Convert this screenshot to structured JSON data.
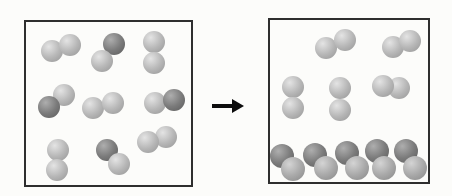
{
  "scene": {
    "width": 452,
    "height": 196,
    "background": "#fcfcfa",
    "panel_border_color": "#2e2e2e",
    "panel_border_width": 2
  },
  "shades": {
    "light": {
      "base": "#b7b7b7",
      "highlight": "#e4e4e4",
      "edge": "#969696"
    },
    "dark": {
      "base": "#7b7b7b",
      "highlight": "#aeaeae",
      "edge": "#5c5c5c"
    },
    "medium": {
      "base": "#a9a9a9",
      "highlight": "#d4d4d4",
      "edge": "#898989"
    }
  },
  "arrow": {
    "x": 212,
    "y": 99,
    "width": 32,
    "height": 14,
    "shaft_length": 20,
    "shaft_thickness": 4,
    "color": "#0d0d0d"
  },
  "panels": [
    {
      "name": "before-box",
      "x": 24,
      "y": 20,
      "width": 169,
      "height": 167,
      "molecules": [
        {
          "atoms": [
            {
              "cx": 52,
              "cy": 51,
              "r": 11,
              "shade": "light"
            },
            {
              "cx": 70,
              "cy": 45,
              "r": 11,
              "shade": "light"
            }
          ]
        },
        {
          "atoms": [
            {
              "cx": 114,
              "cy": 44,
              "r": 11,
              "shade": "dark"
            },
            {
              "cx": 102,
              "cy": 61,
              "r": 11,
              "shade": "light"
            }
          ]
        },
        {
          "atoms": [
            {
              "cx": 154,
              "cy": 42,
              "r": 11,
              "shade": "light"
            },
            {
              "cx": 154,
              "cy": 63,
              "r": 11,
              "shade": "light"
            }
          ]
        },
        {
          "atoms": [
            {
              "cx": 64,
              "cy": 95,
              "r": 11,
              "shade": "light"
            },
            {
              "cx": 49,
              "cy": 107,
              "r": 11,
              "shade": "dark"
            }
          ]
        },
        {
          "atoms": [
            {
              "cx": 93,
              "cy": 108,
              "r": 11,
              "shade": "light"
            },
            {
              "cx": 113,
              "cy": 103,
              "r": 11,
              "shade": "light"
            }
          ]
        },
        {
          "atoms": [
            {
              "cx": 155,
              "cy": 103,
              "r": 11,
              "shade": "light"
            },
            {
              "cx": 174,
              "cy": 100,
              "r": 11,
              "shade": "dark"
            }
          ]
        },
        {
          "atoms": [
            {
              "cx": 58,
              "cy": 150,
              "r": 11,
              "shade": "light"
            },
            {
              "cx": 57,
              "cy": 170,
              "r": 11,
              "shade": "light"
            }
          ]
        },
        {
          "atoms": [
            {
              "cx": 107,
              "cy": 150,
              "r": 11,
              "shade": "dark"
            },
            {
              "cx": 119,
              "cy": 164,
              "r": 11,
              "shade": "light"
            }
          ]
        },
        {
          "atoms": [
            {
              "cx": 166,
              "cy": 137,
              "r": 11,
              "shade": "light"
            },
            {
              "cx": 148,
              "cy": 142,
              "r": 11,
              "shade": "light"
            }
          ]
        }
      ]
    },
    {
      "name": "after-box",
      "x": 268,
      "y": 18,
      "width": 162,
      "height": 166,
      "molecules": [
        {
          "atoms": [
            {
              "cx": 326,
              "cy": 48,
              "r": 11,
              "shade": "light"
            },
            {
              "cx": 345,
              "cy": 40,
              "r": 11,
              "shade": "light"
            }
          ]
        },
        {
          "atoms": [
            {
              "cx": 393,
              "cy": 47,
              "r": 11,
              "shade": "light"
            },
            {
              "cx": 410,
              "cy": 41,
              "r": 11,
              "shade": "light"
            }
          ]
        },
        {
          "atoms": [
            {
              "cx": 293,
              "cy": 87,
              "r": 11,
              "shade": "light"
            },
            {
              "cx": 293,
              "cy": 108,
              "r": 11,
              "shade": "light"
            }
          ]
        },
        {
          "atoms": [
            {
              "cx": 340,
              "cy": 88,
              "r": 11,
              "shade": "light"
            },
            {
              "cx": 340,
              "cy": 110,
              "r": 11,
              "shade": "light"
            }
          ]
        },
        {
          "atoms": [
            {
              "cx": 399,
              "cy": 88,
              "r": 11,
              "shade": "light"
            },
            {
              "cx": 383,
              "cy": 86,
              "r": 11,
              "shade": "light"
            }
          ]
        },
        {
          "atoms": [
            {
              "cx": 282,
              "cy": 156,
              "r": 12,
              "shade": "dark"
            },
            {
              "cx": 293,
              "cy": 169,
              "r": 12,
              "shade": "medium"
            }
          ]
        },
        {
          "atoms": [
            {
              "cx": 315,
              "cy": 155,
              "r": 12,
              "shade": "dark"
            },
            {
              "cx": 326,
              "cy": 168,
              "r": 12,
              "shade": "medium"
            }
          ]
        },
        {
          "atoms": [
            {
              "cx": 347,
              "cy": 153,
              "r": 12,
              "shade": "dark"
            },
            {
              "cx": 357,
              "cy": 168,
              "r": 12,
              "shade": "medium"
            }
          ]
        },
        {
          "atoms": [
            {
              "cx": 377,
              "cy": 151,
              "r": 12,
              "shade": "dark"
            },
            {
              "cx": 384,
              "cy": 168,
              "r": 12,
              "shade": "medium"
            }
          ]
        },
        {
          "atoms": [
            {
              "cx": 406,
              "cy": 151,
              "r": 12,
              "shade": "dark"
            },
            {
              "cx": 415,
              "cy": 168,
              "r": 12,
              "shade": "medium"
            }
          ]
        }
      ]
    }
  ]
}
